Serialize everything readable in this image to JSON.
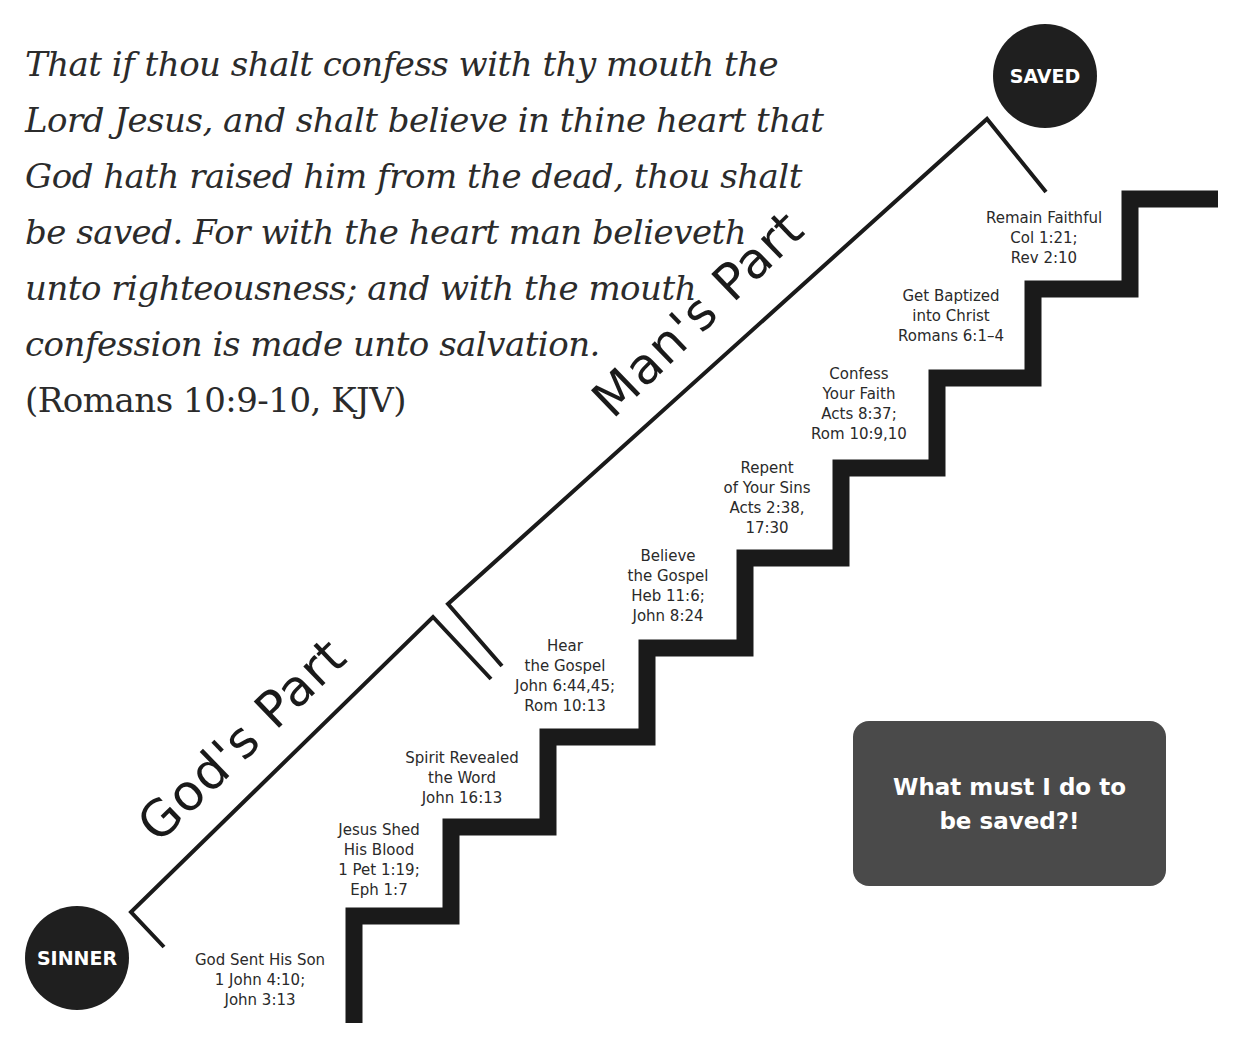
{
  "verse": {
    "lines": [
      "That if thou shalt confess with thy mouth the",
      "Lord Jesus, and shalt believe in thine heart that",
      "God hath raised him from the dead, thou shalt",
      "be saved. For with the heart man believeth",
      "unto righteousness; and with the mouth",
      "confession is made unto salvation."
    ],
    "citation": "(Romans 10:9-10, KJV)"
  },
  "endpoints": {
    "start": "SINNER",
    "end": "SAVED"
  },
  "parts": {
    "gods_part": "God's Part",
    "mans_part": "Man's Part"
  },
  "steps": [
    {
      "lines": [
        "God Sent His Son",
        "1 John 4:10;",
        "John 3:13"
      ]
    },
    {
      "lines": [
        "Jesus Shed",
        "His Blood",
        "1 Pet 1:19;",
        "Eph 1:7"
      ]
    },
    {
      "lines": [
        "Spirit Revealed",
        "the Word",
        "John 16:13"
      ]
    },
    {
      "lines": [
        "Hear",
        "the Gospel",
        "John 6:44,45;",
        "Rom 10:13"
      ]
    },
    {
      "lines": [
        "Believe",
        "the Gospel",
        "Heb 11:6;",
        "John 8:24"
      ]
    },
    {
      "lines": [
        "Repent",
        "of Your Sins",
        "Acts 2:38,",
        "17:30"
      ]
    },
    {
      "lines": [
        "Confess",
        "Your Faith",
        "Acts 8:37;",
        "Rom 10:9,10"
      ]
    },
    {
      "lines": [
        "Get Baptized",
        "into Christ",
        "Romans 6:1–4"
      ]
    },
    {
      "lines": [
        "Remain Faithful",
        "Col 1:21;",
        "Rev 2:10"
      ]
    }
  ],
  "callout": {
    "line1": "What must I do to",
    "line2": "be saved?!"
  },
  "colors": {
    "ink": "#1a1a1a",
    "callout_bg": "#4a4a4a",
    "circle_bg": "#1f1f1f"
  }
}
